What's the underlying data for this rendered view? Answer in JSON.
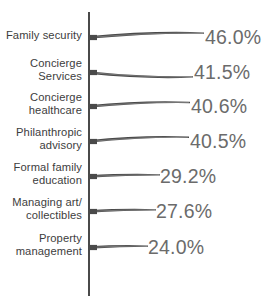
{
  "chart_data": {
    "type": "bar",
    "orientation": "horizontal",
    "title": "",
    "subtitle": "",
    "xlabel": "",
    "ylabel": "",
    "grid": false,
    "legend": false,
    "legend_position": "none",
    "axis_line": "vertical-left",
    "value_suffix": "%",
    "xlim": [
      0,
      50
    ],
    "categories": [
      "Family security",
      "Concierge\nServices",
      "Concierge\nhealthcare",
      "Philanthropic\nadvisory",
      "Formal family\neducation",
      "Managing art/\ncollectibles",
      "Property\nmanagement"
    ],
    "values": [
      46.0,
      41.5,
      40.6,
      40.5,
      29.2,
      27.6,
      24.0
    ],
    "value_labels": [
      "46.0%",
      "41.5%",
      "40.6%",
      "40.5%",
      "29.2%",
      "27.6%",
      "24.0%"
    ],
    "bar_color": "#4a4a4a",
    "label_color": "#3d3d3d",
    "value_color": "#6b6b6b",
    "background": "#ffffff"
  },
  "bars": [
    {
      "label": "Family security",
      "label_lines": "Family security",
      "value": 46.0,
      "value_label": "46.0%",
      "top": 20,
      "bar_len": 116,
      "bulge": -4.4,
      "val_x": 205
    },
    {
      "label": "Concierge Services",
      "label_lines": "Concierge\nServices",
      "value": 41.5,
      "value_label": "41.5%",
      "top": 55,
      "bar_len": 105,
      "bulge": 4.4,
      "val_x": 194
    },
    {
      "label": "Concierge healthcare",
      "label_lines": "Concierge\nhealthcare",
      "value": 40.6,
      "value_label": "40.6%",
      "top": 89,
      "bar_len": 102,
      "bulge": -4.0,
      "val_x": 191
    },
    {
      "label": "Philanthropic advisory",
      "label_lines": "Philanthropic\nadvisory",
      "value": 40.5,
      "value_label": "40.5%",
      "top": 124,
      "bar_len": 101,
      "bulge": -4.2,
      "val_x": 190
    },
    {
      "label": "Formal family education",
      "label_lines": "Formal family\neducation",
      "value": 29.2,
      "value_label": "29.2%",
      "top": 159,
      "bar_len": 72,
      "bulge": -1.6,
      "val_x": 160
    },
    {
      "label": "Managing art/ collectibles",
      "label_lines": "Managing art/\ncollectibles",
      "value": 27.6,
      "value_label": "27.6%",
      "top": 194,
      "bar_len": 68,
      "bulge": -1.6,
      "val_x": 156
    },
    {
      "label": "Property management",
      "label_lines": "Property\nmanagement",
      "value": 24.0,
      "value_label": "24.0%",
      "top": 230,
      "bar_len": 60,
      "bulge": -1.4,
      "val_x": 148
    }
  ]
}
